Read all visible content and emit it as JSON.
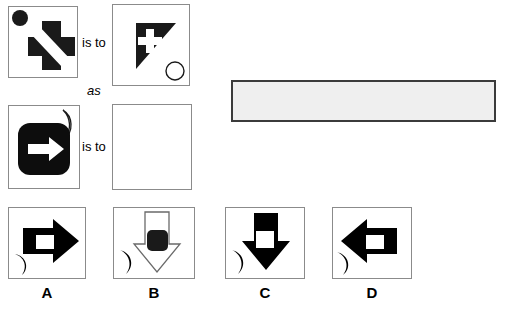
{
  "puzzle": {
    "type": "visual-analogy-matrix",
    "relation_labels": {
      "is_to_1": "is to",
      "as": "as",
      "is_to_2": "is to"
    },
    "rows": [
      {
        "id": "row-1",
        "left_panel": {
          "name": "panel-a1",
          "shapes": [
            {
              "kind": "circle-filled",
              "fill": "#000000",
              "position": "top-left"
            },
            {
              "kind": "cross-plus",
              "fill": "#1a1a1a",
              "position": "center",
              "overlay": "white-diagonal-band"
            }
          ]
        },
        "right_panel": {
          "name": "panel-a2",
          "shapes": [
            {
              "kind": "triangle-right-angle-top-left",
              "fill": "#1a1a1a",
              "position": "center"
            },
            {
              "kind": "cross-plus",
              "fill": "#ffffff",
              "position": "inside-triangle"
            },
            {
              "kind": "circle-outline",
              "stroke": "#000000",
              "position": "bottom-right"
            }
          ]
        }
      },
      {
        "id": "row-2",
        "left_panel": {
          "name": "panel-b1",
          "shapes": [
            {
              "kind": "rounded-square-filled",
              "fill": "#000000",
              "position": "center"
            },
            {
              "kind": "arrow-right",
              "fill": "#ffffff",
              "position": "inside-square"
            },
            {
              "kind": "crescent-moon-outline",
              "stroke": "#000000",
              "position": "top-right"
            }
          ]
        },
        "right_panel": {
          "name": "panel-b2-question",
          "shapes": [],
          "empty": true
        }
      }
    ],
    "options": [
      {
        "label": "A",
        "name": "option-a",
        "shapes": [
          {
            "kind": "arrow-right-block",
            "fill": "#000000",
            "position": "center"
          },
          {
            "kind": "rectangle-hole",
            "fill": "#ffffff",
            "position": "inside-arrow"
          },
          {
            "kind": "crescent-moon-filled",
            "fill": "#000000",
            "position": "bottom-left"
          }
        ]
      },
      {
        "label": "B",
        "name": "option-b",
        "shapes": [
          {
            "kind": "arrow-down-block-outline",
            "fill": "#ffffff",
            "stroke": "#555555",
            "position": "center"
          },
          {
            "kind": "rounded-square-filled",
            "fill": "#1a1a1a",
            "position": "inside-arrow"
          },
          {
            "kind": "crescent-moon-filled",
            "fill": "#000000",
            "position": "bottom-left"
          }
        ]
      },
      {
        "label": "C",
        "name": "option-c",
        "shapes": [
          {
            "kind": "arrow-down-block",
            "fill": "#000000",
            "position": "center"
          },
          {
            "kind": "rectangle-hole",
            "fill": "#ffffff",
            "position": "inside-arrow"
          },
          {
            "kind": "crescent-moon-filled",
            "fill": "#000000",
            "position": "bottom-left"
          }
        ]
      },
      {
        "label": "D",
        "name": "option-d",
        "shapes": [
          {
            "kind": "arrow-left-block",
            "fill": "#000000",
            "position": "center"
          },
          {
            "kind": "rectangle-hole",
            "fill": "#ffffff",
            "position": "inside-arrow"
          },
          {
            "kind": "crescent-moon-filled",
            "fill": "#000000",
            "position": "bottom-left"
          }
        ]
      }
    ],
    "answer_bar": {
      "name": "answer-display-bar",
      "text": "",
      "fill": "#efefef",
      "border": "#3b3b3b"
    }
  },
  "colors": {
    "ink": "#000000",
    "shape_black": "#1a1a1a",
    "panel_border": "#8b8b8b",
    "bar_fill": "#efefef",
    "bar_border": "#3b3b3b",
    "background": "#ffffff"
  }
}
